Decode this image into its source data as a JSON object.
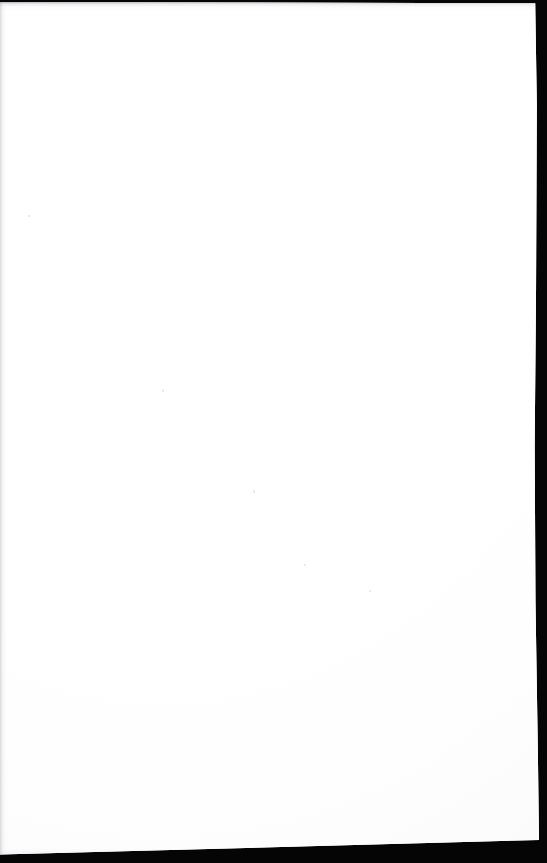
{
  "document": {
    "kind": "scanned-page",
    "title": "",
    "page_text": "",
    "body_lines": [],
    "header": "",
    "footer": "",
    "page_number": "",
    "is_blank": true,
    "blank_note": ""
  },
  "canvas": {
    "width_px": 547,
    "height_px": 863
  },
  "colors": {
    "paper": "#ffffff",
    "scan_backdrop": "#050505",
    "frame": "#0a0a0a",
    "seam_shadow": "#8c8c92",
    "speck": "#cdcdd4"
  },
  "scan_artifacts": {
    "top_seam_label": "top scan seam",
    "left_seam_label": "left scan seam",
    "bottom_seam_label": "bottom scan seam",
    "right_backdrop_label": "right scanner backdrop",
    "bottom_backdrop_label": "bottom scanner backdrop"
  }
}
